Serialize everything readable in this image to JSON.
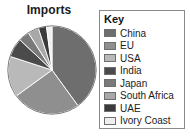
{
  "chart": {
    "title": "Imports"
  },
  "legend": {
    "title": "Key",
    "border_color": "#8a8a8a"
  },
  "chart_data": {
    "type": "pie",
    "title": "Imports",
    "xlabel": "",
    "ylabel": "",
    "legend_title": "Key",
    "legend_position": "right",
    "grid": false,
    "start_angle_deg": 0,
    "direction": "clockwise",
    "categories": [
      "China",
      "EU",
      "USA",
      "India",
      "Japan",
      "South Africa",
      "UAE",
      "Ivory Coast"
    ],
    "values": [
      40,
      25,
      15,
      7,
      4,
      4,
      3,
      2
    ],
    "colors": [
      "#6e6e6e",
      "#8f8f8f",
      "#b9b9b9",
      "#4b4b4b",
      "#7a7a7a",
      "#a8a8a8",
      "#3a3a3a",
      "#efefef"
    ],
    "slices": [
      {
        "label": "China",
        "value": 40,
        "color": "#6e6e6e"
      },
      {
        "label": "EU",
        "value": 25,
        "color": "#8f8f8f"
      },
      {
        "label": "USA",
        "value": 15,
        "color": "#b9b9b9"
      },
      {
        "label": "India",
        "value": 7,
        "color": "#4b4b4b"
      },
      {
        "label": "Japan",
        "value": 4,
        "color": "#7a7a7a"
      },
      {
        "label": "South Africa",
        "value": 4,
        "color": "#a8a8a8"
      },
      {
        "label": "UAE",
        "value": 3,
        "color": "#3a3a3a"
      },
      {
        "label": "Ivory Coast",
        "value": 2,
        "color": "#efefef"
      }
    ]
  }
}
